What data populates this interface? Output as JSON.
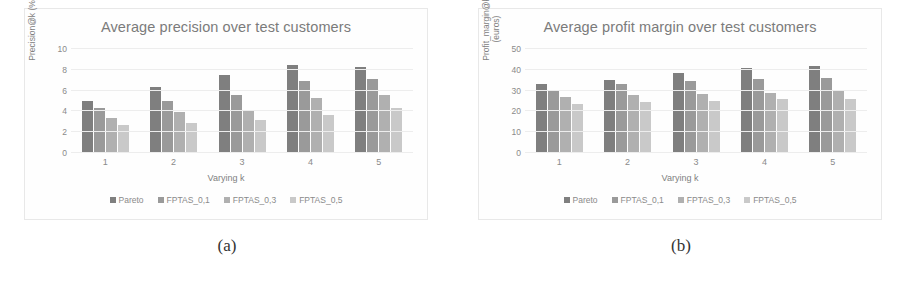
{
  "figure": {
    "panels": [
      {
        "subcaption": "(a)",
        "chart_data": {
          "type": "bar",
          "title": "Average precision over test customers",
          "xlabel": "Varying k",
          "ylabel": "Precision@k (%)",
          "categories": [
            "1",
            "2",
            "3",
            "4",
            "5"
          ],
          "yticks": [
            "0",
            "2",
            "4",
            "6",
            "8",
            "10"
          ],
          "ylim": [
            0,
            10
          ],
          "grid": true,
          "legend_position": "bottom",
          "series": [
            {
              "name": "Pareto",
              "color": "#7f7f7f",
              "values": [
                5.0,
                6.3,
                7.5,
                8.5,
                8.3
              ]
            },
            {
              "name": "FPTAS_0,1",
              "color": "#9a9a9a",
              "values": [
                4.3,
                5.0,
                5.6,
                6.9,
                7.1
              ]
            },
            {
              "name": "FPTAS_0,3",
              "color": "#b0b0b0",
              "values": [
                3.4,
                3.9,
                4.1,
                5.3,
                5.6
              ]
            },
            {
              "name": "FPTAS_0,5",
              "color": "#c9c9c9",
              "values": [
                2.7,
                2.9,
                3.2,
                3.7,
                4.3
              ]
            }
          ]
        }
      },
      {
        "subcaption": "(b)",
        "chart_data": {
          "type": "bar",
          "title": "Average profit margin over test customers",
          "xlabel": "Varying k",
          "ylabel": "Profit_margin@k\n(euros)",
          "categories": [
            "1",
            "2",
            "3",
            "4",
            "5"
          ],
          "yticks": [
            "0",
            "10",
            "20",
            "30",
            "40",
            "50"
          ],
          "ylim": [
            0,
            50
          ],
          "grid": true,
          "legend_position": "bottom",
          "series": [
            {
              "name": "Pareto",
              "color": "#7f7f7f",
              "values": [
                33,
                35,
                38.5,
                41,
                42
              ]
            },
            {
              "name": "FPTAS_0,1",
              "color": "#9a9a9a",
              "values": [
                30,
                33,
                34.5,
                35.5,
                36
              ]
            },
            {
              "name": "FPTAS_0,3",
              "color": "#b0b0b0",
              "values": [
                27,
                28,
                28.5,
                29,
                30
              ]
            },
            {
              "name": "FPTAS_0,5",
              "color": "#c9c9c9",
              "values": [
                23.5,
                24.5,
                25,
                26,
                26
              ]
            }
          ]
        }
      }
    ]
  }
}
